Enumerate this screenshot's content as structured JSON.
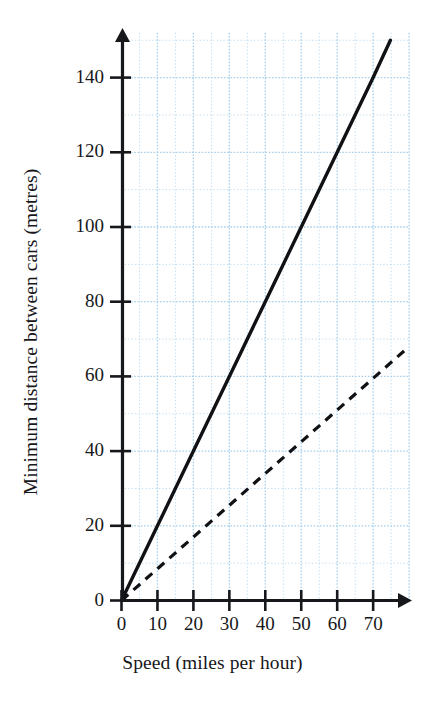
{
  "chart_data": {
    "type": "line",
    "title": "",
    "xlabel": "Speed (miles per hour)",
    "ylabel": "Minimum distance between cars (metres)",
    "xlim": [
      0,
      80
    ],
    "ylim": [
      0,
      152
    ],
    "x_ticks": [
      0,
      10,
      20,
      30,
      40,
      50,
      60,
      70
    ],
    "y_ticks": [
      0,
      20,
      40,
      60,
      80,
      100,
      120,
      140
    ],
    "x_tick_labels": [
      "0",
      "10",
      "20",
      "30",
      "40",
      "50",
      "60",
      "70"
    ],
    "y_tick_labels": [
      "0",
      "20",
      "40",
      "60",
      "80",
      "100",
      "120",
      "140"
    ],
    "grid": {
      "visible": true,
      "color": "#bfdcf0",
      "major_color": "#a8d0ea",
      "style": "dotted",
      "x_minor_step": 5,
      "y_minor_step": 10,
      "x_major_step": 10,
      "y_major_step": 20,
      "x_extent": [
        0,
        80
      ],
      "y_extent": [
        0,
        152
      ]
    },
    "legend": {
      "visible": false,
      "position": "none"
    },
    "axis_color": "#16181c",
    "axis_arrows": true,
    "series": [
      {
        "name": "solid-line",
        "style": "solid",
        "color": "#101114",
        "width": 3.4,
        "slope": 2.0,
        "intercept": 0,
        "points": [
          {
            "x": 0,
            "y": 0
          },
          {
            "x": 10,
            "y": 20
          },
          {
            "x": 20,
            "y": 40
          },
          {
            "x": 30,
            "y": 60
          },
          {
            "x": 40,
            "y": 80
          },
          {
            "x": 50,
            "y": 100
          },
          {
            "x": 60,
            "y": 120
          },
          {
            "x": 70,
            "y": 140
          },
          {
            "x": 74.8,
            "y": 150
          }
        ]
      },
      {
        "name": "dashed-line",
        "style": "dashed",
        "color": "#101114",
        "width": 3.2,
        "slope": 0.85,
        "intercept": 0,
        "points": [
          {
            "x": 0,
            "y": 0
          },
          {
            "x": 10,
            "y": 8.5
          },
          {
            "x": 20,
            "y": 17
          },
          {
            "x": 30,
            "y": 25.5
          },
          {
            "x": 40,
            "y": 34
          },
          {
            "x": 50,
            "y": 42.5
          },
          {
            "x": 60,
            "y": 51
          },
          {
            "x": 70,
            "y": 59.5
          },
          {
            "x": 80,
            "y": 68
          }
        ]
      }
    ]
  }
}
